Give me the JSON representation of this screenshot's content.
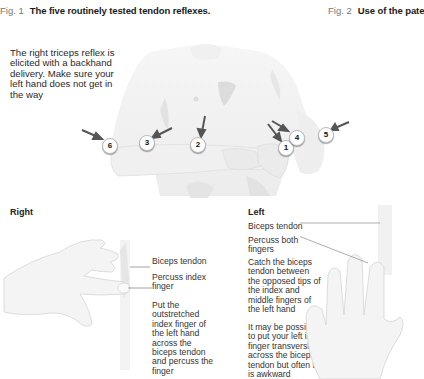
{
  "figure1": {
    "number": "Fig. 1",
    "title": "The five routinely tested tendon reflexes.",
    "intro_text": [
      "The right triceps reflex is",
      "elicited with a backhand",
      "delivery. Make sure your",
      "left hand does not get in",
      "the way"
    ],
    "markers": [
      "1",
      "2",
      "3",
      "4",
      "5",
      "6"
    ]
  },
  "figure2": {
    "number": "Fig. 2",
    "title": "Use of the pate"
  },
  "right_panel": {
    "heading": "Right",
    "label_biceps": "Biceps tendon",
    "label_percuss": [
      "Percuss index",
      "finger"
    ],
    "instruction": [
      "Put the",
      "outstretched",
      "index finger of",
      "the left hand",
      "across the",
      "biceps tendon",
      "and percuss the",
      "finger"
    ]
  },
  "left_panel": {
    "heading": "Left",
    "label_biceps": "Biceps tendon",
    "label_percuss": [
      "Percuss both",
      "fingers"
    ],
    "instruction": [
      "Catch the biceps",
      "tendon between",
      "the opposed tips of",
      "the index and",
      "middle fingers of",
      "the left hand"
    ],
    "note": [
      "It may be possible",
      "to put your left index",
      "finger transversly",
      "across the biceps",
      "tendon but often this",
      "is awkward"
    ]
  },
  "colors": {
    "skin": "#f2f2f2",
    "shadow": "#d9d9d9",
    "arrow": "#555555"
  }
}
